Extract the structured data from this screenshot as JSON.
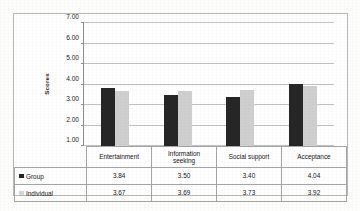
{
  "chart_data": {
    "type": "bar",
    "title": "",
    "xlabel": "",
    "ylabel": "Scores",
    "ylim": [
      1.0,
      7.0
    ],
    "ytick_labels": [
      "7.00",
      "6.00",
      "5.00",
      "4.00",
      "3.00",
      "2.00",
      "1.00"
    ],
    "ytick_values": [
      7.0,
      6.0,
      5.0,
      4.0,
      3.0,
      2.0,
      1.0
    ],
    "grid": true,
    "legend_position": "bottom-table",
    "categories": [
      "Entertainment",
      "Information seeking",
      "Social support",
      "Acceptance"
    ],
    "series": [
      {
        "name": "Group",
        "color": "#262626",
        "values": [
          3.84,
          3.5,
          3.4,
          4.04
        ],
        "labels": [
          "3.84",
          "3.50",
          "3.40",
          "4.04"
        ]
      },
      {
        "name": "Individual",
        "color": "#cfcfcf",
        "values": [
          3.67,
          3.69,
          3.73,
          3.92
        ],
        "labels": [
          "3.67",
          "3.69",
          "3.73",
          "3.92"
        ]
      }
    ]
  },
  "categories_display": [
    {
      "line1": "Entertainment",
      "line2": ""
    },
    {
      "line1": "Information",
      "line2": "seeking"
    },
    {
      "line1": "Social support",
      "line2": ""
    },
    {
      "line1": "Acceptance",
      "line2": ""
    }
  ]
}
